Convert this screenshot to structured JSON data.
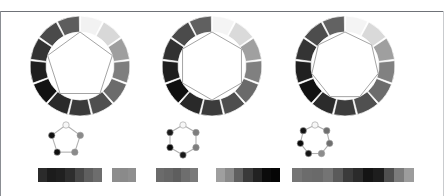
{
  "figure": {
    "background_color": "#ffffff",
    "rule_color": "#6f7278",
    "panel_count": 3,
    "width": 444,
    "height": 196
  },
  "panels": [
    {
      "name": "panel-pentagon",
      "polygon_sides": 5,
      "polygon_label": "pentagon",
      "wheel": {
        "center_x": 80,
        "center_y": 66,
        "outer_radius": 50,
        "inner_radius": 34,
        "segment_count": 13,
        "start_angle_deg": -90,
        "segment_colors": [
          "#f2f2f2",
          "#d8d8d8",
          "#9e9e9e",
          "#7e7e7e",
          "#6b6b6b",
          "#4f4f4f",
          "#3a3a3a",
          "#2a2a2a",
          "#121212",
          "#1f1f1f",
          "#333333",
          "#4a4a4a",
          "#5d5d5d"
        ]
      },
      "polygon": {
        "stroke_color": "#9a9a9a",
        "fill_color": "#ffffff",
        "radius": 34
      },
      "graph": {
        "center_x": 66,
        "center_y": 140,
        "radius": 15,
        "node_radius": 3.2,
        "edge_color": "#b0b0b0",
        "node_count": 5,
        "node_colors": [
          "#f7f7f7",
          "#8a8a8a",
          "#8a8a8a",
          "#111111",
          "#111111"
        ],
        "node_outline": "#9a9a9a"
      },
      "strips": [
        {
          "name": "strip-a",
          "x": 38,
          "y": 168,
          "width": 64,
          "cells": [
            "#2b2b2b",
            "#1c1c1c",
            "#202020",
            "#2e2e2e",
            "#484848",
            "#5f5f5f",
            "#6d6d6d"
          ]
        },
        {
          "name": "strip-b",
          "x": 112,
          "y": 168,
          "width": 24,
          "cells": [
            "#8d8d8d",
            "#8a8a8a",
            "#8f8f8f"
          ]
        }
      ]
    },
    {
      "name": "panel-hexagon",
      "polygon_sides": 6,
      "polygon_label": "hexagon",
      "wheel": {
        "center_x": 212,
        "center_y": 66,
        "outer_radius": 50,
        "inner_radius": 34,
        "segment_count": 13,
        "start_angle_deg": -90,
        "segment_colors": [
          "#f4f4f4",
          "#dadada",
          "#a0a0a0",
          "#808080",
          "#6a6a6a",
          "#4e4e4e",
          "#3b3b3b",
          "#292929",
          "#101010",
          "#1e1e1e",
          "#313131",
          "#4b4b4b",
          "#606060"
        ]
      },
      "polygon": {
        "stroke_color": "#9a9a9a",
        "fill_color": "#ffffff",
        "radius": 34
      },
      "graph": {
        "center_x": 183,
        "center_y": 140,
        "radius": 15,
        "node_radius": 3.2,
        "edge_color": "#b0b0b0",
        "node_count": 6,
        "node_colors": [
          "#f7f7f7",
          "#7e7e7e",
          "#7e7e7e",
          "#1a1a1a",
          "#0a0a0a",
          "#1a1a1a"
        ],
        "node_outline": "#9a9a9a"
      },
      "strips": [
        {
          "name": "strip-a",
          "x": 156,
          "y": 168,
          "width": 42,
          "cells": [
            "#6b6b6b",
            "#666666",
            "#5e5e5e",
            "#6e6e6e",
            "#7a7a7a"
          ]
        },
        {
          "name": "strip-b",
          "x": 216,
          "y": 168,
          "width": 64,
          "cells": [
            "#9f9f9f",
            "#8a8a8a",
            "#606060",
            "#3a3a3a",
            "#222222",
            "#0b0b0b",
            "#050505"
          ]
        }
      ]
    },
    {
      "name": "panel-heptagon",
      "polygon_sides": 7,
      "polygon_label": "heptagon",
      "wheel": {
        "center_x": 345,
        "center_y": 66,
        "outer_radius": 50,
        "inner_radius": 34,
        "segment_count": 13,
        "start_angle_deg": -90,
        "segment_colors": [
          "#f4f4f4",
          "#d9d9d9",
          "#9f9f9f",
          "#818181",
          "#6c6c6c",
          "#505050",
          "#3c3c3c",
          "#2b2b2b",
          "#111111",
          "#202020",
          "#343434",
          "#4d4d4d",
          "#626262"
        ]
      },
      "polygon": {
        "stroke_color": "#9a9a9a",
        "fill_color": "#ffffff",
        "radius": 34
      },
      "graph": {
        "center_x": 315,
        "center_y": 140,
        "radius": 15,
        "node_radius": 3.2,
        "edge_color": "#b0b0b0",
        "node_count": 7,
        "node_colors": [
          "#f7f7f7",
          "#6f6f6f",
          "#6f6f6f",
          "#8d8d8d",
          "#141414",
          "#0a0a0a",
          "#141414"
        ],
        "node_outline": "#9a9a9a"
      },
      "strips": [
        {
          "name": "strip-a",
          "x": 292,
          "y": 168,
          "width": 122,
          "cells": [
            "#757575",
            "#6c6c6c",
            "#6a6a6a",
            "#747474",
            "#5a5a5a",
            "#3b3b3b",
            "#2b2b2b",
            "#141414",
            "#1d1d1d",
            "#4f4f4f",
            "#7b7b7b",
            "#9c9c9c"
          ]
        }
      ]
    }
  ],
  "chart_data": {
    "type": "heatmap",
    "xlabel": "",
    "ylabel": "",
    "series": [
      {
        "name": "pentagon-ring",
        "categories": [
          "s1",
          "s2",
          "s3",
          "s4",
          "s5",
          "s6",
          "s7",
          "s8",
          "s9",
          "s10",
          "s11",
          "s12",
          "s13"
        ],
        "values": [
          0.95,
          0.85,
          0.62,
          0.49,
          0.42,
          0.31,
          0.23,
          0.16,
          0.07,
          0.12,
          0.2,
          0.29,
          0.36
        ]
      },
      {
        "name": "hexagon-ring",
        "categories": [
          "s1",
          "s2",
          "s3",
          "s4",
          "s5",
          "s6",
          "s7",
          "s8",
          "s9",
          "s10",
          "s11",
          "s12",
          "s13"
        ],
        "values": [
          0.96,
          0.86,
          0.63,
          0.5,
          0.42,
          0.31,
          0.23,
          0.16,
          0.06,
          0.12,
          0.19,
          0.29,
          0.38
        ]
      },
      {
        "name": "heptagon-ring",
        "categories": [
          "s1",
          "s2",
          "s3",
          "s4",
          "s5",
          "s6",
          "s7",
          "s8",
          "s9",
          "s10",
          "s11",
          "s12",
          "s13"
        ],
        "values": [
          0.96,
          0.85,
          0.62,
          0.51,
          0.42,
          0.31,
          0.24,
          0.17,
          0.07,
          0.13,
          0.2,
          0.3,
          0.38
        ]
      }
    ],
    "legend_position": "none",
    "grid": false
  }
}
